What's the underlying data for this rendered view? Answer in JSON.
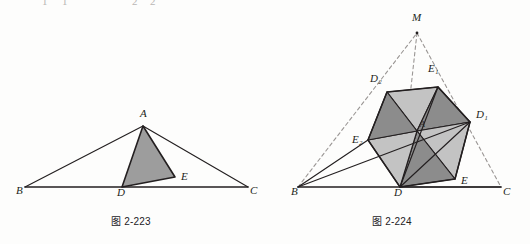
{
  "page": {
    "width": 530,
    "height": 244,
    "background": "#fdfdfc",
    "ink": "#231f20",
    "dashed_color": "#9a9694",
    "fill_dark": "#8c8c8c",
    "fill_light": "#c3c3c3",
    "fill_mid": "#a8a8a8",
    "solid_triangle_fill": "#9d9d9d"
  },
  "cut_row": {
    "fragments": [
      "1",
      "1",
      "2",
      "2"
    ]
  },
  "figures": [
    {
      "id": "fig-2-223",
      "caption": "图 2-223",
      "description": "triangle-abc-with-shaded-triangle-ade",
      "points": {
        "A": {
          "x": 143,
          "y": 126,
          "label": "A",
          "label_x": 140,
          "label_y": 117
        },
        "B": {
          "x": 25,
          "y": 187,
          "label": "B",
          "label_x": 16,
          "label_y": 194
        },
        "C": {
          "x": 248,
          "y": 187,
          "label": "C",
          "label_x": 250,
          "label_y": 194
        },
        "D": {
          "x": 122,
          "y": 187,
          "label": "D",
          "label_x": 117,
          "label_y": 196
        },
        "E": {
          "x": 175,
          "y": 177,
          "label": "E",
          "label_x": 181,
          "label_y": 180
        }
      },
      "solid_edges": [
        [
          "B",
          "A"
        ],
        [
          "A",
          "C"
        ],
        [
          "B",
          "C"
        ]
      ],
      "shaded_polygon": [
        "A",
        "D",
        "E"
      ]
    },
    {
      "id": "fig-2-224",
      "caption": "图 2-224",
      "description": "hexagon-of-six-shaded-triangles-inside-triangle-bmc",
      "points": {
        "M": {
          "x": 417,
          "y": 33,
          "label": "M",
          "label_x": 412,
          "label_y": 21
        },
        "B": {
          "x": 298,
          "y": 187,
          "label": "B",
          "label_x": 291,
          "label_y": 195
        },
        "C": {
          "x": 501,
          "y": 187,
          "label": "C",
          "label_x": 503,
          "label_y": 195
        },
        "A": {
          "x": 417,
          "y": 131,
          "label": "A",
          "label_x": 420,
          "label_y": 127
        },
        "D": {
          "x": 400,
          "y": 187,
          "label": "D",
          "label_x": 394,
          "label_y": 196
        },
        "E": {
          "x": 455,
          "y": 179,
          "label": "E",
          "label_x": 461,
          "label_y": 184
        },
        "D1": {
          "x": 470,
          "y": 122,
          "label": "D₁",
          "label_x": 476,
          "label_y": 118
        },
        "E1": {
          "x": 438,
          "y": 87,
          "label": "E₁",
          "label_x": 428,
          "label_y": 72
        },
        "D2": {
          "x": 387,
          "y": 92,
          "label": "D₂",
          "label_x": 370,
          "label_y": 82
        },
        "E2": {
          "x": 368,
          "y": 140,
          "label": "E₂",
          "label_x": 352,
          "label_y": 143
        }
      },
      "dashed_edges": [
        [
          "B",
          "M"
        ],
        [
          "M",
          "C"
        ],
        [
          "M",
          "D"
        ]
      ],
      "solid_edges": [
        [
          "B",
          "C"
        ],
        [
          "B",
          "E2"
        ],
        [
          "B",
          "D1"
        ],
        [
          "D",
          "C"
        ],
        [
          "D",
          "D1"
        ],
        [
          "D",
          "E1"
        ]
      ],
      "hexagon": [
        "D2",
        "E1",
        "D1",
        "E",
        "D",
        "E2"
      ],
      "shaded_triangles": [
        {
          "verts": [
            "A",
            "D2",
            "E1"
          ],
          "tone": "light"
        },
        {
          "verts": [
            "A",
            "E1",
            "D1"
          ],
          "tone": "dark"
        },
        {
          "verts": [
            "A",
            "D1",
            "E"
          ],
          "tone": "light"
        },
        {
          "verts": [
            "A",
            "E",
            "D"
          ],
          "tone": "dark"
        },
        {
          "verts": [
            "A",
            "D",
            "E2"
          ],
          "tone": "light"
        },
        {
          "verts": [
            "A",
            "E2",
            "D2"
          ],
          "tone": "dark"
        }
      ]
    }
  ]
}
